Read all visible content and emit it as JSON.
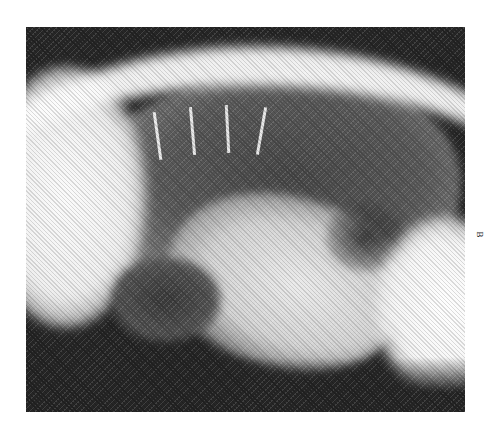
{
  "figure": {
    "type": "lateral thoracic radiograph",
    "panel_label": "B",
    "alt": "Lateral thoracic radiograph showing lung fields, ribs, and cardiac silhouette"
  },
  "colors": {
    "background": "#ffffff",
    "film_dark": "#2a2a2a",
    "tissue_bright": "#f0f0f0"
  }
}
